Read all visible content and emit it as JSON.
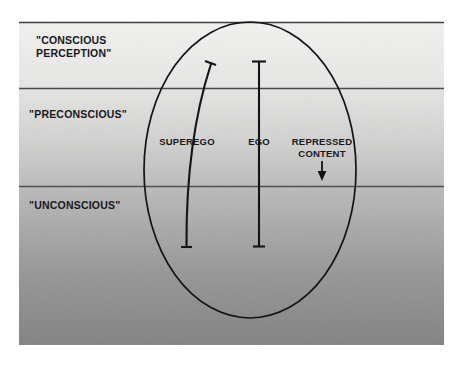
{
  "diagram": {
    "canvas": {
      "width": 463,
      "height": 366,
      "background": "#ffffff"
    },
    "panel": {
      "x": 19,
      "y": 22,
      "width": 425,
      "height": 323,
      "gradient_top_color": "#efefed",
      "gradient_bottom_color": "#838384",
      "border_color": "#3d3d3f"
    },
    "zones": [
      {
        "name": "conscious-perception",
        "label": "\"CONSCIOUS\nPERCEPTION\"",
        "boundary_y": 22
      },
      {
        "name": "preconscious",
        "label": "\"PRECONSCIOUS\"",
        "boundary_y": 88
      },
      {
        "name": "unconscious",
        "label": "\"UNCONSCIOUS\"",
        "boundary_y": 186
      }
    ],
    "divider_color": "#3d3d3f",
    "ellipse": {
      "name": "psyche-boundary",
      "cx": 250,
      "cy": 170,
      "rx": 106,
      "ry": 148,
      "stroke": "#141416",
      "stroke_width": 1.7
    },
    "structures": [
      {
        "name": "superego",
        "label": "SUPEREGO",
        "type": "curved-bar",
        "top_x": 212,
        "top_y": 62,
        "bottom_x": 186,
        "bottom_y": 248,
        "label_x": 187,
        "label_y": 140
      },
      {
        "name": "ego",
        "label": "EGO",
        "type": "straight-bar",
        "top_x": 259,
        "top_y": 61,
        "bottom_x": 259,
        "bottom_y": 247,
        "label_x": 259,
        "label_y": 140
      }
    ],
    "flows": [
      {
        "name": "repressed-content",
        "label": "REPRESSED\nCONTENT",
        "arrow_direction": "down",
        "arrow_x": 322,
        "arrow_y_start": 162,
        "arrow_y_end": 180,
        "label_x": 322,
        "label_y": 140
      }
    ],
    "stroke_color": "#141416"
  }
}
